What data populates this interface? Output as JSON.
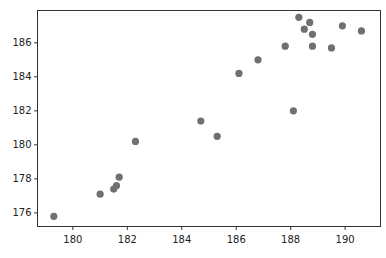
{
  "chart_data": {
    "type": "scatter",
    "title": "",
    "xlabel": "",
    "ylabel": "",
    "xlim": [
      178.7,
      191.3
    ],
    "ylim": [
      175.2,
      187.9
    ],
    "grid": false,
    "legend": null,
    "x_ticks": [
      180,
      182,
      184,
      186,
      188,
      190
    ],
    "y_ticks": [
      176,
      178,
      180,
      182,
      184,
      186
    ],
    "x_tick_labels": [
      "180",
      "182",
      "184",
      "186",
      "188",
      "190"
    ],
    "y_tick_labels": [
      "176",
      "178",
      "180",
      "182",
      "184",
      "186"
    ],
    "marker_color": "#707070",
    "series": [
      {
        "name": "points",
        "points": [
          {
            "x": 179.3,
            "y": 175.8
          },
          {
            "x": 181.0,
            "y": 177.1
          },
          {
            "x": 181.5,
            "y": 177.4
          },
          {
            "x": 181.6,
            "y": 177.6
          },
          {
            "x": 181.7,
            "y": 178.1
          },
          {
            "x": 182.3,
            "y": 180.2
          },
          {
            "x": 184.7,
            "y": 181.4
          },
          {
            "x": 185.3,
            "y": 180.5
          },
          {
            "x": 186.1,
            "y": 184.2
          },
          {
            "x": 186.8,
            "y": 185.0
          },
          {
            "x": 187.8,
            "y": 185.8
          },
          {
            "x": 188.1,
            "y": 182.0
          },
          {
            "x": 188.3,
            "y": 187.5
          },
          {
            "x": 188.5,
            "y": 186.8
          },
          {
            "x": 188.7,
            "y": 187.2
          },
          {
            "x": 188.8,
            "y": 186.5
          },
          {
            "x": 188.8,
            "y": 185.8
          },
          {
            "x": 189.5,
            "y": 185.7
          },
          {
            "x": 189.9,
            "y": 187.0
          },
          {
            "x": 190.6,
            "y": 186.7
          }
        ]
      }
    ]
  }
}
